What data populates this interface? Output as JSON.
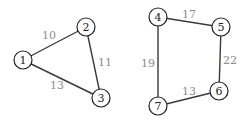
{
  "graphs": [
    {
      "name": "triangle-graph",
      "nodes": [
        {
          "id": "1",
          "label": "1",
          "x": 23,
          "y": 60
        },
        {
          "id": "2",
          "label": "2",
          "x": 86,
          "y": 27
        },
        {
          "id": "3",
          "label": "3",
          "x": 101,
          "y": 98
        }
      ],
      "edges": [
        {
          "from": "1",
          "to": "2",
          "weight": "10",
          "lx": 49,
          "ly": 35
        },
        {
          "from": "2",
          "to": "3",
          "weight": "11",
          "lx": 105,
          "ly": 62
        },
        {
          "from": "1",
          "to": "3",
          "weight": "13",
          "lx": 57,
          "ly": 85
        }
      ]
    },
    {
      "name": "quadrilateral-graph",
      "nodes": [
        {
          "id": "4",
          "label": "4",
          "x": 158,
          "y": 17
        },
        {
          "id": "5",
          "label": "5",
          "x": 221,
          "y": 27
        },
        {
          "id": "6",
          "label": "6",
          "x": 219,
          "y": 91
        },
        {
          "id": "7",
          "label": "7",
          "x": 158,
          "y": 106
        }
      ],
      "edges": [
        {
          "from": "4",
          "to": "5",
          "weight": "17",
          "lx": 189,
          "ly": 14
        },
        {
          "from": "5",
          "to": "6",
          "weight": "22",
          "lx": 230,
          "ly": 60
        },
        {
          "from": "4",
          "to": "7",
          "weight": "19",
          "lx": 148,
          "ly": 63
        },
        {
          "from": "7",
          "to": "6",
          "weight": "13",
          "lx": 189,
          "ly": 91
        }
      ]
    }
  ],
  "style": {
    "node_radius": 9,
    "edge_color": "#3a3a3a",
    "node_stroke": "#222222",
    "weight_label_color": "#8a8a8a",
    "background": "#ffffff"
  }
}
